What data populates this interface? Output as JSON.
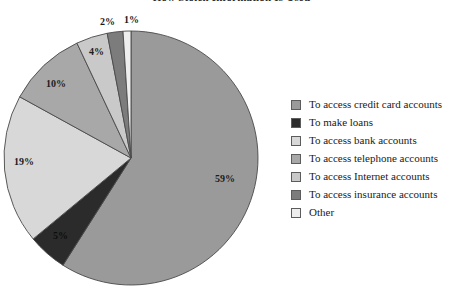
{
  "chart_data": {
    "type": "pie",
    "title": "How Stolen Information Is Used",
    "xlabel": "",
    "ylabel": "",
    "legend_position": "right",
    "grid": false,
    "categories": [
      "To access credit card accounts",
      "To make loans",
      "To access bank accounts",
      "To access telephone accounts",
      "To access Internet accounts",
      "To access insurance accounts",
      "Other"
    ],
    "values": [
      59,
      5,
      19,
      10,
      4,
      2,
      1
    ],
    "value_labels": [
      "59%",
      "5%",
      "19%",
      "10%",
      "4%",
      "2%",
      "1%"
    ],
    "colors": [
      "#9a9a9a",
      "#2b2b2b",
      "#d8d8d8",
      "#a8a8a8",
      "#c9c9c9",
      "#7c7c7c",
      "#eeeeee"
    ],
    "start_angle_deg": 0,
    "direction": "clockwise"
  },
  "legend": {
    "items": [
      {
        "label": "To access credit card accounts",
        "color": "#9a9a9a"
      },
      {
        "label": "To make loans",
        "color": "#2b2b2b"
      },
      {
        "label": "To access bank accounts",
        "color": "#d8d8d8"
      },
      {
        "label": "To access telephone accounts",
        "color": "#a8a8a8"
      },
      {
        "label": "To access Internet accounts",
        "color": "#c9c9c9"
      },
      {
        "label": "To access insurance accounts",
        "color": "#7c7c7c"
      },
      {
        "label": "Other",
        "color": "#eeeeee"
      }
    ]
  },
  "labels": {
    "p59": "59%",
    "p5": "5%",
    "p19": "19%",
    "p10": "10%",
    "p4": "4%",
    "p2": "2%",
    "p1": "1%"
  }
}
